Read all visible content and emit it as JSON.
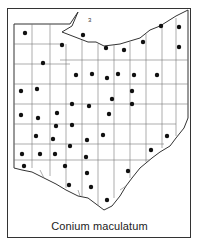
{
  "figure": {
    "caption": "Conium maculatum",
    "map_region": "Ohio county distribution map",
    "lake_label": "3"
  },
  "colors": {
    "outline": "#333333",
    "county_lines": "#666666",
    "dot": "#111111",
    "background": "#ffffff"
  },
  "dots": [
    {
      "x": 25,
      "y": 33
    },
    {
      "x": 62,
      "y": 45
    },
    {
      "x": 83,
      "y": 35
    },
    {
      "x": 106,
      "y": 48
    },
    {
      "x": 124,
      "y": 50
    },
    {
      "x": 143,
      "y": 42
    },
    {
      "x": 161,
      "y": 26
    },
    {
      "x": 179,
      "y": 27
    },
    {
      "x": 179,
      "y": 47
    },
    {
      "x": 43,
      "y": 63
    },
    {
      "x": 76,
      "y": 75
    },
    {
      "x": 92,
      "y": 74
    },
    {
      "x": 107,
      "y": 78
    },
    {
      "x": 118,
      "y": 74
    },
    {
      "x": 134,
      "y": 75
    },
    {
      "x": 157,
      "y": 75
    },
    {
      "x": 21,
      "y": 91
    },
    {
      "x": 37,
      "y": 89
    },
    {
      "x": 72,
      "y": 104
    },
    {
      "x": 89,
      "y": 106
    },
    {
      "x": 112,
      "y": 99
    },
    {
      "x": 132,
      "y": 91
    },
    {
      "x": 132,
      "y": 104
    },
    {
      "x": 21,
      "y": 115
    },
    {
      "x": 38,
      "y": 118
    },
    {
      "x": 57,
      "y": 113
    },
    {
      "x": 56,
      "y": 126
    },
    {
      "x": 72,
      "y": 125
    },
    {
      "x": 109,
      "y": 114
    },
    {
      "x": 36,
      "y": 136
    },
    {
      "x": 53,
      "y": 139
    },
    {
      "x": 87,
      "y": 140
    },
    {
      "x": 103,
      "y": 135
    },
    {
      "x": 167,
      "y": 136
    },
    {
      "x": 22,
      "y": 154
    },
    {
      "x": 40,
      "y": 154
    },
    {
      "x": 55,
      "y": 154
    },
    {
      "x": 70,
      "y": 146
    },
    {
      "x": 86,
      "y": 157
    },
    {
      "x": 151,
      "y": 150
    },
    {
      "x": 24,
      "y": 166
    },
    {
      "x": 65,
      "y": 166
    },
    {
      "x": 87,
      "y": 173
    },
    {
      "x": 128,
      "y": 171
    },
    {
      "x": 69,
      "y": 185
    },
    {
      "x": 91,
      "y": 187
    },
    {
      "x": 107,
      "y": 200
    }
  ]
}
